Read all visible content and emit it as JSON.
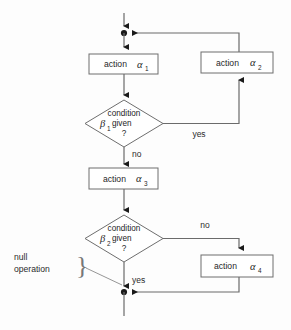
{
  "diagram": {
    "kind": "flowchart",
    "title": "",
    "nodes": {
      "action1": {
        "label": "action",
        "symbol": "α",
        "subscript": "1"
      },
      "action2": {
        "label": "action",
        "symbol": "α",
        "subscript": "2"
      },
      "action3": {
        "label": "action",
        "symbol": "α",
        "subscript": "3"
      },
      "action4": {
        "label": "action",
        "symbol": "α",
        "subscript": "4"
      },
      "condition1": {
        "line1": "condition",
        "symbol": "β",
        "subscript": "1",
        "line2": "given",
        "line3": "?"
      },
      "condition2": {
        "line1": "condition",
        "symbol": "β",
        "subscript": "2",
        "line2": "given",
        "line3": "?"
      }
    },
    "edge_labels": {
      "cond1_yes": "yes",
      "cond1_no": "no",
      "cond2_no": "no",
      "cond2_yes": "yes"
    },
    "annotation": {
      "line1": "null",
      "line2": "operation",
      "brace": "}"
    },
    "colors": {
      "background": "#fdfdfd",
      "node_stroke": "#6e6e6e",
      "node_fill": "#ffffff",
      "connector": "#6b6b6b",
      "text": "#1f1f1f",
      "junction": "#1a1a1a"
    }
  }
}
